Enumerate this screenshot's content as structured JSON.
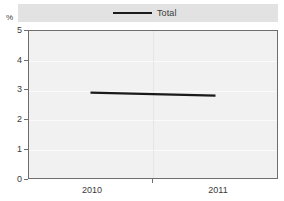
{
  "chart_data": {
    "type": "line",
    "title": "",
    "subtitle": "",
    "xlabel": "",
    "ylabel": "%",
    "unit_label": "%",
    "categories": [
      "2010",
      "2011"
    ],
    "x": [
      2010,
      2011
    ],
    "xlim": [
      2009.5,
      2011.5
    ],
    "ylim": [
      0,
      5
    ],
    "yticks": [
      0,
      1,
      2,
      3,
      4,
      5
    ],
    "ytick_labels": [
      "0",
      "1",
      "2",
      "3",
      "4",
      "5"
    ],
    "xtick_labels": [
      "2010",
      "2011"
    ],
    "grid": true,
    "grid_axis": "both",
    "legend_position": "top",
    "series": [
      {
        "name": "Total",
        "values": [
          2.9,
          2.8
        ],
        "color": "#1a1a1a",
        "style": "solid",
        "width": 2
      }
    ],
    "annotations": []
  },
  "legend": {
    "entries": [
      {
        "label": "Total",
        "color": "#1a1a1a"
      }
    ],
    "band_color": "#e2e2e2"
  },
  "axes": {
    "unit": "%",
    "y_labels": [
      "5",
      "4",
      "3",
      "2",
      "1",
      "0"
    ],
    "x_labels": [
      "2010",
      "2011"
    ]
  },
  "colors": {
    "page_background": "#ffffff",
    "plot_background": "#f1f1f1",
    "frame": "#6e6e6e",
    "gridline": "#fbfbfb",
    "series": "#1a1a1a",
    "text": "#3a3a3a",
    "legend_band": "#e2e2e2"
  }
}
